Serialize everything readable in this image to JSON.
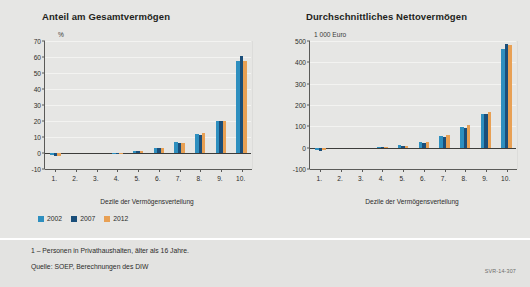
{
  "figure": {
    "background_color": "#e6e6e4",
    "footer_background_color": "#e3e3e1",
    "signature": "SVR-14-307",
    "footnotes": [
      "1 – Personen in Privathaushalten, älter als 16 Jahre.",
      "Quelle: SOEP, Berechnungen des DIW"
    ]
  },
  "legend": {
    "position": "below-left-chart",
    "entries": [
      {
        "label": "2002",
        "color": "#2E8FBF"
      },
      {
        "label": "2007",
        "color": "#1A4E7A"
      },
      {
        "label": "2012",
        "color": "#E8A054"
      }
    ]
  },
  "chart_data": [
    {
      "id": "anteil-am-gesamtvermoegen",
      "type": "bar",
      "title": "Anteil am Gesamtvermögen",
      "ylabel": "%",
      "xlabel": "Dezile der Vermögensverteilung",
      "ylim": [
        -10,
        70
      ],
      "yticks": [
        -10,
        0,
        10,
        20,
        30,
        40,
        50,
        60,
        70
      ],
      "ytick_labels": [
        "-10",
        "0",
        "10",
        "20",
        "30",
        "40",
        "50",
        "60",
        "70"
      ],
      "grid": true,
      "categories": [
        "1.",
        "2.",
        "3.",
        "4.",
        "5.",
        "6.",
        "7.",
        "8.",
        "9.",
        "10."
      ],
      "series": [
        {
          "name": "2002",
          "color": "#2E8FBF",
          "values": [
            -1.5,
            0.0,
            0.0,
            0.2,
            1.2,
            3.3,
            6.8,
            12.0,
            19.9,
            57.2
          ]
        },
        {
          "name": "2007",
          "color": "#1A4E7A",
          "values": [
            -1.8,
            0.0,
            0.0,
            0.2,
            1.0,
            3.0,
            6.2,
            11.3,
            19.7,
            60.7
          ]
        },
        {
          "name": "2012",
          "color": "#E8A054",
          "values": [
            -1.7,
            0.0,
            0.0,
            0.2,
            1.0,
            3.2,
            6.5,
            12.2,
            20.2,
            57.8
          ]
        }
      ]
    },
    {
      "id": "durchschnittliches-nettovermoegen",
      "type": "bar",
      "title": "Durchschnittliches Nettovermögen",
      "ylabel": "1 000 Euro",
      "xlabel": "Dezile der Vermögensverteilung",
      "ylim": [
        -100,
        500
      ],
      "yticks": [
        -100,
        0,
        100,
        200,
        300,
        400,
        500
      ],
      "ytick_labels": [
        "-100",
        "0",
        "100",
        "200",
        "300",
        "400",
        "500"
      ],
      "grid": true,
      "categories": [
        "1.",
        "2.",
        "3.",
        "4.",
        "5.",
        "6.",
        "7.",
        "8.",
        "9.",
        "10."
      ],
      "series": [
        {
          "name": "2002",
          "color": "#2E8FBF",
          "values": [
            -12,
            0,
            0,
            2,
            11,
            27,
            57,
            99,
            160,
            461
          ]
        },
        {
          "name": "2007",
          "color": "#1A4E7A",
          "values": [
            -14,
            0,
            0,
            2,
            9,
            24,
            51,
            93,
            156,
            486
          ]
        },
        {
          "name": "2012",
          "color": "#E8A054",
          "values": [
            -13,
            0,
            0,
            2,
            10,
            26,
            58,
            104,
            165,
            481
          ]
        }
      ]
    }
  ]
}
